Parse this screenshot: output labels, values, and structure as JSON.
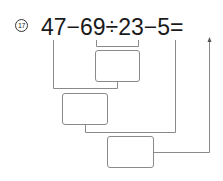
{
  "problem": {
    "number": "17",
    "expression": "47−69÷23−5=",
    "tokens": [
      "47",
      "−",
      "69",
      "÷",
      "23",
      "−",
      "5",
      "="
    ]
  },
  "answer_boxes": [
    {
      "step": 1,
      "operation": "69÷23",
      "value": ""
    },
    {
      "step": 2,
      "operation": "47−(step1)",
      "value": ""
    },
    {
      "step": 3,
      "operation": "(step2)−5",
      "value": ""
    }
  ],
  "colors": {
    "text": "#1a1a1a",
    "lines": "#8a8a8a"
  }
}
